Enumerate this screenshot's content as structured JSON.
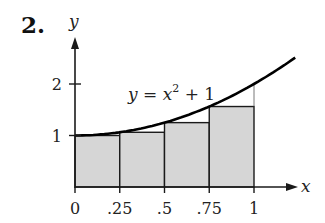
{
  "problem": {
    "number": "2."
  },
  "colors": {
    "fill": "#d6d6d6",
    "stroke": "#1a1a1a",
    "curve": "#000000",
    "guide": "#555555"
  },
  "chart_data": {
    "type": "area",
    "title": "",
    "function_label": "y = x² + 1",
    "function_label_parts": {
      "lhs": "y = x",
      "exp": "2",
      "rhs": " + 1"
    },
    "xlabel": "x",
    "ylabel": "y",
    "xlim": [
      0,
      1.23
    ],
    "ylim": [
      0,
      2.6
    ],
    "x_ticks": [
      0,
      0.25,
      0.5,
      0.75,
      1
    ],
    "x_tick_labels": [
      "0",
      ".25",
      ".5",
      ".75",
      "1"
    ],
    "y_ticks": [
      1,
      2
    ],
    "y_tick_labels": [
      "1",
      "2"
    ],
    "grid": false,
    "legend": "none",
    "rectangles": {
      "rule": "left endpoint",
      "width": 0.25,
      "left_x": [
        0,
        0.25,
        0.5,
        0.75
      ],
      "heights": [
        1,
        1.0625,
        1.25,
        1.5625
      ]
    },
    "curve": {
      "expression": "x^2 + 1",
      "x": [
        0,
        0.25,
        0.5,
        0.75,
        1,
        1.23
      ],
      "y": [
        1,
        1.0625,
        1.25,
        1.5625,
        2,
        2.5129
      ]
    }
  }
}
